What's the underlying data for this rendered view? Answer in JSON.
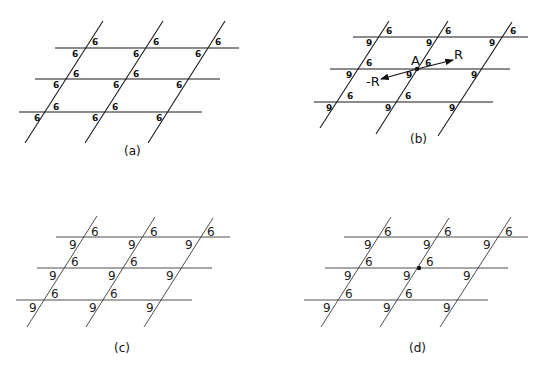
{
  "panels": {
    "a": {
      "caption": "(a)",
      "labels": [
        "6",
        "6",
        "6",
        "6",
        "6",
        "6",
        "6",
        "6",
        "6",
        "6",
        "6",
        "6",
        "6",
        "6",
        "6",
        "6"
      ]
    },
    "b": {
      "caption": "(b)",
      "labels": {
        "top_right": "6",
        "bottom_left": "9"
      },
      "point_label": "A",
      "vector_pos": "R",
      "vector_neg": "-R"
    },
    "c": {
      "caption": "(c)",
      "labels": {
        "upright": "6",
        "rotated": "9"
      }
    },
    "d": {
      "caption": "(d)",
      "labels": {
        "upright": "6",
        "rotated": "9"
      }
    }
  },
  "colors": {
    "line": "#1a1a1a",
    "background": "#ffffff"
  }
}
